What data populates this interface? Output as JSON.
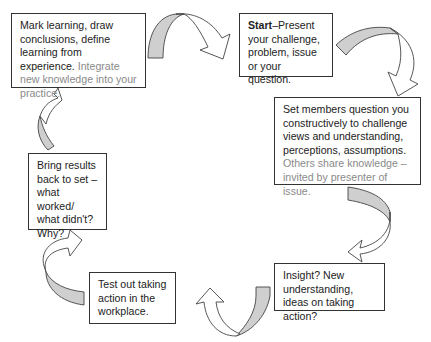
{
  "diagram": {
    "type": "cycle",
    "steps": [
      {
        "id": "start",
        "bold": "Start",
        "text": "–Present your challenge, problem, issue or your question.",
        "grey": ""
      },
      {
        "id": "question",
        "text": "Set members question you constructively to challenge views and understanding, perceptions, assumptions.",
        "grey": "Others share knowledge – invited by presenter of issue."
      },
      {
        "id": "insight",
        "text": "Insight? New understanding, ideas on taking action?"
      },
      {
        "id": "test",
        "text": "Test out taking action in the workplace."
      },
      {
        "id": "results",
        "text": "Bring results back to set – what worked/ what didn't? Why?"
      },
      {
        "id": "mark",
        "text": "Mark learning, draw conclusions, define learning from experience.",
        "grey": "Integrate new knowledge into your practice."
      }
    ],
    "arrows": [
      {
        "from": "mark",
        "to": "start",
        "icon": "curved-arrow-icon"
      },
      {
        "from": "start",
        "to": "question",
        "icon": "curved-arrow-icon"
      },
      {
        "from": "question",
        "to": "insight",
        "icon": "curved-arrow-icon"
      },
      {
        "from": "insight",
        "to": "test",
        "icon": "curved-arrow-icon"
      },
      {
        "from": "test",
        "to": "results",
        "icon": "curved-arrow-icon"
      },
      {
        "from": "results",
        "to": "mark",
        "icon": "curved-arrow-icon"
      }
    ],
    "colors": {
      "border": "#333333",
      "text": "#222222",
      "secondary_text": "#8a8a8a",
      "arrow_shade": "#cfcfcf"
    }
  }
}
